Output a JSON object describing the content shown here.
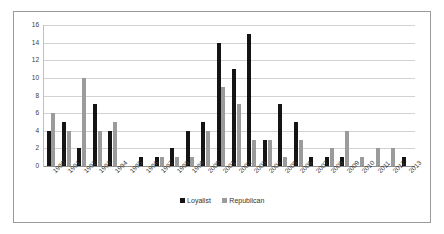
{
  "chart_data": {
    "type": "bar",
    "title": "",
    "xlabel": "",
    "ylabel": "",
    "ylim": [
      0,
      16
    ],
    "yticks": [
      0,
      2,
      4,
      6,
      8,
      10,
      12,
      14,
      16
    ],
    "grid": true,
    "legend_position": "bottom",
    "categories": [
      "1990",
      "1991",
      "1992",
      "1993",
      "1994",
      "1995",
      "1996",
      "1997",
      "1998",
      "1999",
      "2000",
      "2001",
      "2002",
      "2003",
      "2004",
      "2005",
      "2006",
      "2007",
      "2008",
      "2009",
      "2010",
      "2011",
      "2012",
      "2013"
    ],
    "series": [
      {
        "name": "Loyalist",
        "color": "#141414",
        "values": [
          4,
          5,
          2,
          7,
          4,
          0,
          1,
          1,
          2,
          4,
          5,
          14,
          11,
          15,
          3,
          7,
          5,
          1,
          1,
          1,
          0,
          0,
          0,
          1
        ]
      },
      {
        "name": "Republican",
        "color": "#9b9b9b",
        "values": [
          6,
          4,
          10,
          4,
          5,
          0,
          0,
          1,
          1,
          1,
          4,
          9,
          7,
          3,
          3,
          1,
          3,
          0,
          2,
          4,
          1,
          2,
          2,
          0
        ]
      }
    ]
  },
  "legend": {
    "items": [
      {
        "label": "Loyalist",
        "color": "#141414"
      },
      {
        "label": "Republican",
        "color": "#9b9b9b"
      }
    ]
  }
}
